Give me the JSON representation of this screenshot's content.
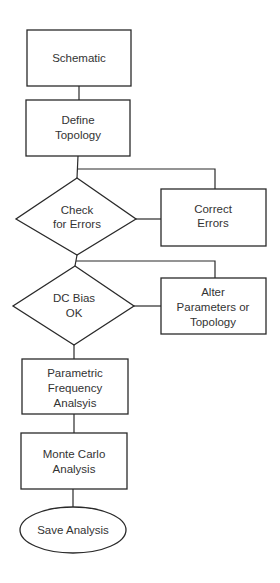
{
  "diagram": {
    "type": "flowchart",
    "nodes": {
      "schematic": {
        "shape": "rectangle",
        "lines": [
          "Schematic"
        ]
      },
      "define_topology": {
        "shape": "rectangle",
        "lines": [
          "Define",
          "Topology"
        ]
      },
      "check_errors": {
        "shape": "diamond",
        "lines": [
          "Check",
          "for Errors"
        ]
      },
      "correct_errors": {
        "shape": "rectangle",
        "lines": [
          "Correct",
          "Errors"
        ]
      },
      "dc_bias": {
        "shape": "diamond",
        "lines": [
          "DC Bias",
          "OK"
        ]
      },
      "alter_params": {
        "shape": "rectangle",
        "lines": [
          "Alter",
          "Parameters or",
          "Topology"
        ]
      },
      "parametric": {
        "shape": "rectangle",
        "lines": [
          "Parametric",
          "Frequency",
          "Analsyis"
        ]
      },
      "monte_carlo": {
        "shape": "rectangle",
        "lines": [
          "Monte Carlo",
          "Analysis"
        ]
      },
      "save_analysis": {
        "shape": "ellipse",
        "lines": [
          "Save Analysis"
        ]
      }
    },
    "edges": [
      [
        "schematic",
        "define_topology"
      ],
      [
        "define_topology",
        "check_errors"
      ],
      [
        "check_errors",
        "correct_errors"
      ],
      [
        "correct_errors",
        "check_errors"
      ],
      [
        "check_errors",
        "dc_bias"
      ],
      [
        "dc_bias",
        "alter_params"
      ],
      [
        "alter_params",
        "dc_bias"
      ],
      [
        "dc_bias",
        "parametric"
      ],
      [
        "parametric",
        "monte_carlo"
      ],
      [
        "monte_carlo",
        "save_analysis"
      ]
    ]
  }
}
